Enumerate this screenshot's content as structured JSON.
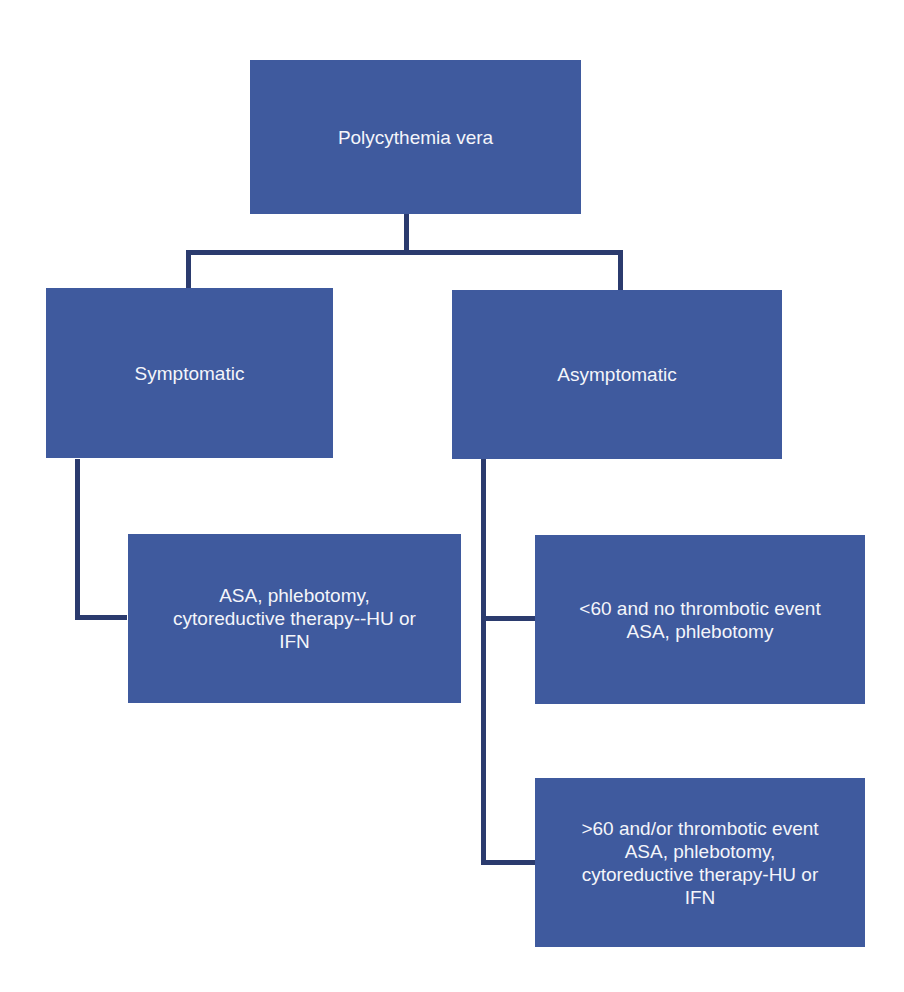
{
  "diagram": {
    "type": "flowchart",
    "colors": {
      "box_fill": "#3f5a9e",
      "box_text": "#f4f5fa",
      "connector": "#2b3b6e",
      "background": "#ffffff"
    },
    "nodes": {
      "root": {
        "label": "Polycythemia vera"
      },
      "symptomatic": {
        "label": "Symptomatic"
      },
      "asymptomatic": {
        "label": "Asymptomatic"
      },
      "symptomatic_treatment": {
        "label": "ASA, phlebotomy,\ncytoreductive therapy--HU or\nIFN"
      },
      "asym_low_risk": {
        "label": "<60 and no thrombotic event\nASA, phlebotomy"
      },
      "asym_high_risk": {
        "label": ">60 and/or  thrombotic event\nASA, phlebotomy,\ncytoreductive therapy-HU or\nIFN"
      }
    },
    "edges": [
      {
        "from": "root",
        "to": "symptomatic"
      },
      {
        "from": "root",
        "to": "asymptomatic"
      },
      {
        "from": "symptomatic",
        "to": "symptomatic_treatment"
      },
      {
        "from": "asymptomatic",
        "to": "asym_low_risk"
      },
      {
        "from": "asymptomatic",
        "to": "asym_high_risk"
      }
    ]
  }
}
